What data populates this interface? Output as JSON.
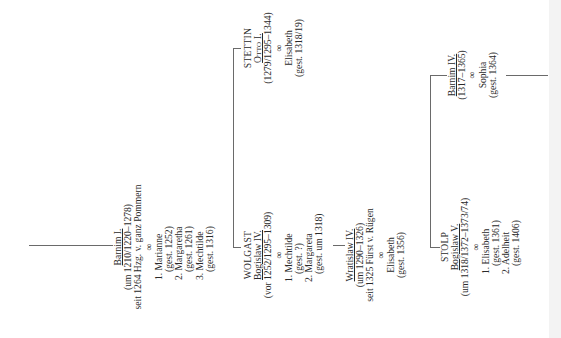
{
  "diagram": {
    "type": "genealogy-tree",
    "orientation": "rotated-90-ccw",
    "nodes": {
      "barnim1": {
        "name": "Barnim I.",
        "dates": "(um 1210/1220–1278)",
        "note": "seit 1264 Hzg. v. ganz Pommern",
        "marriage_symbol": "∞",
        "spouses": [
          "1. Marianne",
          "(gest. 1252)",
          "2. Margaretha",
          "(gest. 1261)",
          "3. Mechtilde",
          "(gest. 1316)"
        ]
      },
      "stettin": {
        "line": "STETTIN",
        "name": "Otto I.",
        "dates": "(1279/1295–1344)",
        "marriage_symbol": "∞",
        "spouses": [
          "Elisabeth",
          "(gest. 1318/19)"
        ]
      },
      "wolgast": {
        "line": "WOLGAST",
        "name": "Bogislaw IV.",
        "dates": "(vor 1252/1295–1309)",
        "marriage_symbol": "∞",
        "spouses": [
          "1. Mechtilde",
          "(gest. ?)",
          "2. Margareta",
          "(gest. um 1318)"
        ]
      },
      "wratislaw4": {
        "name": "Wratislaw IV.",
        "dates": "(um 1290–1326)",
        "note": "seit 1325 Fürst v. Rügen",
        "marriage_symbol": "∞",
        "spouses": [
          "Elisabeth",
          "(gest. 1356)"
        ]
      },
      "barnim4": {
        "name": "Barnim IV.",
        "dates": "(1317–1365)",
        "marriage_symbol": "∞",
        "spouses": [
          "Sophia",
          "(gest. 1364)"
        ]
      },
      "stolp": {
        "line": "STOLP",
        "name": "Bogislaw V.",
        "dates": "(um 1318/1372–1373/74)",
        "marriage_symbol": "∞",
        "spouses": [
          "1. Elisabeth",
          "(gest. 1361)",
          "2. Adelheit",
          "(gest. 1406)"
        ]
      }
    },
    "edges": [
      [
        "barnim1",
        "stettin"
      ],
      [
        "barnim1",
        "wolgast"
      ],
      [
        "wolgast",
        "wratislaw4"
      ],
      [
        "wratislaw4",
        "barnim4"
      ],
      [
        "wratislaw4",
        "stolp"
      ]
    ],
    "colors": {
      "line": "#6a6a6a",
      "text": "#2a2a2a",
      "background": "#ffffff",
      "edge_strip": "#f3f3f3"
    }
  }
}
